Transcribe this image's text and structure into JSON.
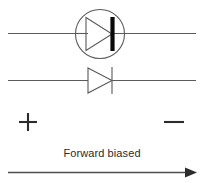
{
  "diagram": {
    "title": "Forward biased diode",
    "caption": "Forward biased",
    "polarity": {
      "positive_label": "+",
      "negative_label": "−"
    },
    "colors": {
      "background": "#ffffff",
      "wire": "#5a5a5a",
      "symbol": "#5a5a5a",
      "cathode_bar": "#0a0a0a",
      "text": "#2b2b2b",
      "arrow": "#2d2d2d"
    },
    "elements": [
      {
        "name": "packaged-diode",
        "type": "diode-in-circle",
        "description": "Diode symbol enclosed in a circle on the upper wire",
        "orientation": "anode-left-cathode-right"
      },
      {
        "name": "plain-diode",
        "type": "diode",
        "description": "Plain diode symbol on the lower wire",
        "orientation": "anode-left-cathode-right"
      }
    ],
    "wires": [
      {
        "name": "upper-wire",
        "y": 33
      },
      {
        "name": "lower-wire",
        "y": 80
      }
    ],
    "direction_arrow": {
      "name": "forward-current-arrow",
      "direction": "right"
    }
  }
}
